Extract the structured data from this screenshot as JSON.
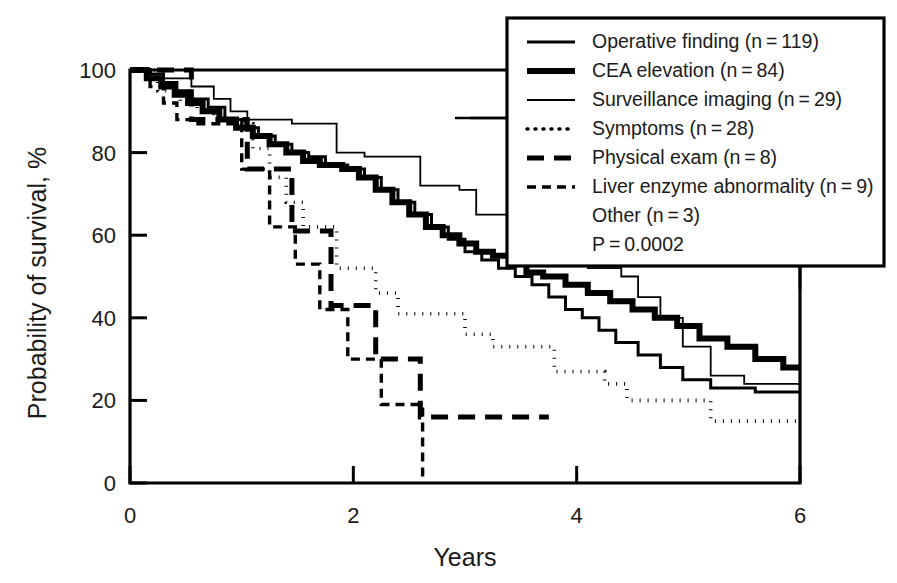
{
  "figure": {
    "kind": "kaplan-meier-survival-plot",
    "background": "#ffffff",
    "ink_color": "#000000"
  },
  "axes": {
    "x_title": "Years",
    "y_title": "Probability of survival, %",
    "x_ticks": [
      "0",
      "2",
      "4",
      "6"
    ],
    "y_ticks": [
      "0",
      "20",
      "40",
      "60",
      "80",
      "100"
    ]
  },
  "legend": {
    "items": [
      {
        "label": "Operative finding (n = 119)",
        "style": "solid-medium",
        "n": 119
      },
      {
        "label": "CEA elevation (n = 84)",
        "style": "solid-thick",
        "n": 84
      },
      {
        "label": "Surveillance imaging (n = 29)",
        "style": "solid-thin",
        "n": 29
      },
      {
        "label": "Symptoms (n = 28)",
        "style": "dotted",
        "n": 28
      },
      {
        "label": "Physical exam (n = 8)",
        "style": "dashed-long",
        "n": 8
      },
      {
        "label": "Liver enzyme abnormality (n = 9)",
        "style": "dash-dot-short",
        "n": 9
      }
    ],
    "extra_lines": [
      "Other (n = 3)",
      "P = 0.0002"
    ]
  },
  "chart_data": {
    "type": "line",
    "title": "",
    "xlabel": "Years",
    "ylabel": "Probability of survival, %",
    "xlim": [
      0,
      6
    ],
    "ylim": [
      0,
      100
    ],
    "xticks": [
      0,
      2,
      4,
      6
    ],
    "yticks": [
      0,
      20,
      40,
      60,
      80,
      100
    ],
    "grid": false,
    "legend_position": "top-right",
    "step_type": "post",
    "annotations": [
      "Other (n = 3)",
      "P = 0.0002"
    ],
    "series": [
      {
        "name": "Operative finding",
        "n": 119,
        "style": "solid-medium",
        "stroke_width": 3.0,
        "dash": "none",
        "points": [
          [
            0.0,
            100
          ],
          [
            0.18,
            99
          ],
          [
            0.3,
            97
          ],
          [
            0.42,
            95
          ],
          [
            0.55,
            93
          ],
          [
            0.7,
            91
          ],
          [
            0.85,
            88
          ],
          [
            1.0,
            86
          ],
          [
            1.15,
            84
          ],
          [
            1.3,
            82
          ],
          [
            1.45,
            80
          ],
          [
            1.6,
            79
          ],
          [
            1.75,
            77
          ],
          [
            1.95,
            76
          ],
          [
            2.1,
            74
          ],
          [
            2.25,
            71
          ],
          [
            2.4,
            68
          ],
          [
            2.55,
            65
          ],
          [
            2.7,
            62
          ],
          [
            2.85,
            59
          ],
          [
            3.0,
            56
          ],
          [
            3.15,
            54
          ],
          [
            3.3,
            52
          ],
          [
            3.45,
            50
          ],
          [
            3.6,
            48
          ],
          [
            3.75,
            45
          ],
          [
            3.9,
            42
          ],
          [
            4.05,
            40
          ],
          [
            4.2,
            37
          ],
          [
            4.35,
            34
          ],
          [
            4.55,
            31
          ],
          [
            4.75,
            28
          ],
          [
            4.95,
            25
          ],
          [
            5.2,
            23
          ],
          [
            5.6,
            22
          ],
          [
            6.0,
            22
          ]
        ]
      },
      {
        "name": "CEA elevation",
        "n": 84,
        "style": "solid-thick",
        "stroke_width": 6.0,
        "dash": "none",
        "points": [
          [
            0.0,
            100
          ],
          [
            0.15,
            98
          ],
          [
            0.28,
            96
          ],
          [
            0.4,
            94
          ],
          [
            0.52,
            92
          ],
          [
            0.65,
            90
          ],
          [
            0.8,
            88
          ],
          [
            0.95,
            86
          ],
          [
            1.1,
            84
          ],
          [
            1.25,
            82
          ],
          [
            1.4,
            80
          ],
          [
            1.55,
            78
          ],
          [
            1.7,
            77
          ],
          [
            1.9,
            76
          ],
          [
            2.05,
            74
          ],
          [
            2.2,
            71
          ],
          [
            2.35,
            68
          ],
          [
            2.5,
            65
          ],
          [
            2.65,
            62
          ],
          [
            2.8,
            60
          ],
          [
            2.95,
            58
          ],
          [
            3.1,
            56
          ],
          [
            3.25,
            55
          ],
          [
            3.4,
            53
          ],
          [
            3.55,
            51
          ],
          [
            3.7,
            50
          ],
          [
            3.9,
            48
          ],
          [
            4.1,
            46
          ],
          [
            4.3,
            44
          ],
          [
            4.5,
            42
          ],
          [
            4.7,
            40
          ],
          [
            4.9,
            38
          ],
          [
            5.1,
            35
          ],
          [
            5.35,
            33
          ],
          [
            5.6,
            30
          ],
          [
            5.85,
            28
          ],
          [
            6.0,
            28
          ]
        ]
      },
      {
        "name": "Surveillance imaging",
        "n": 29,
        "style": "solid-thin",
        "stroke_width": 1.8,
        "dash": "none",
        "points": [
          [
            0.0,
            100
          ],
          [
            0.3,
            98
          ],
          [
            0.55,
            96
          ],
          [
            0.75,
            93
          ],
          [
            0.9,
            90
          ],
          [
            1.05,
            88
          ],
          [
            1.2,
            88
          ],
          [
            1.45,
            87
          ],
          [
            1.7,
            87
          ],
          [
            1.85,
            80
          ],
          [
            2.1,
            79
          ],
          [
            2.45,
            79
          ],
          [
            2.6,
            72
          ],
          [
            2.95,
            71
          ],
          [
            3.1,
            65
          ],
          [
            3.45,
            64
          ],
          [
            3.6,
            58
          ],
          [
            3.95,
            57
          ],
          [
            4.1,
            52
          ],
          [
            4.4,
            50
          ],
          [
            4.55,
            45
          ],
          [
            4.75,
            40
          ],
          [
            4.95,
            33
          ],
          [
            5.2,
            26
          ],
          [
            5.5,
            24
          ],
          [
            6.0,
            24
          ]
        ]
      },
      {
        "name": "Symptoms",
        "n": 28,
        "style": "dotted",
        "stroke_width": 3.6,
        "dash": "1,7",
        "points": [
          [
            0.0,
            100
          ],
          [
            0.25,
            95
          ],
          [
            0.45,
            92
          ],
          [
            0.6,
            90
          ],
          [
            0.75,
            88
          ],
          [
            0.95,
            87
          ],
          [
            1.1,
            81
          ],
          [
            1.25,
            74
          ],
          [
            1.4,
            68
          ],
          [
            1.55,
            62
          ],
          [
            1.7,
            62
          ],
          [
            1.85,
            52
          ],
          [
            2.05,
            52
          ],
          [
            2.2,
            46
          ],
          [
            2.4,
            41
          ],
          [
            2.8,
            41
          ],
          [
            3.0,
            36
          ],
          [
            3.25,
            33
          ],
          [
            3.8,
            27
          ],
          [
            4.05,
            27
          ],
          [
            4.25,
            24
          ],
          [
            4.45,
            20
          ],
          [
            5.0,
            20
          ],
          [
            5.2,
            15
          ],
          [
            6.0,
            15
          ]
        ]
      },
      {
        "name": "Physical exam",
        "n": 8,
        "style": "dashed-long",
        "stroke_width": 5.0,
        "dash": "17,10",
        "points": [
          [
            0.0,
            100
          ],
          [
            0.2,
            100
          ],
          [
            0.38,
            100
          ],
          [
            0.55,
            88
          ],
          [
            0.8,
            88
          ],
          [
            1.05,
            76
          ],
          [
            1.3,
            76
          ],
          [
            1.45,
            61
          ],
          [
            1.65,
            61
          ],
          [
            1.8,
            43
          ],
          [
            2.05,
            43
          ],
          [
            2.2,
            30
          ],
          [
            2.45,
            30
          ],
          [
            2.6,
            16
          ],
          [
            3.05,
            16
          ],
          [
            3.75,
            16
          ]
        ]
      },
      {
        "name": "Liver enzyme abnormality",
        "n": 9,
        "style": "dash-dot-short",
        "stroke_width": 3.4,
        "dash": "9,6",
        "points": [
          [
            0.0,
            100
          ],
          [
            0.18,
            96
          ],
          [
            0.3,
            92
          ],
          [
            0.42,
            88
          ],
          [
            0.58,
            87
          ],
          [
            0.8,
            87
          ],
          [
            1.0,
            76
          ],
          [
            1.12,
            76
          ],
          [
            1.25,
            62
          ],
          [
            1.35,
            62
          ],
          [
            1.48,
            53
          ],
          [
            1.6,
            53
          ],
          [
            1.7,
            42
          ],
          [
            1.85,
            42
          ],
          [
            1.95,
            30
          ],
          [
            2.1,
            30
          ],
          [
            2.25,
            19
          ],
          [
            2.45,
            19
          ],
          [
            2.62,
            19
          ],
          [
            2.62,
            0
          ]
        ]
      }
    ]
  }
}
